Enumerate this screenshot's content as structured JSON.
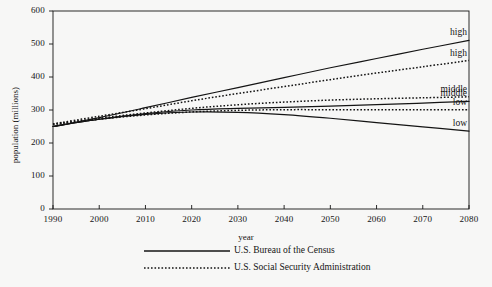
{
  "chart_data": {
    "type": "line",
    "title": "",
    "xlabel": "year",
    "ylabel": "population (millions)",
    "xlim": [
      1990,
      2080
    ],
    "ylim": [
      0,
      600
    ],
    "xticks": [
      1990,
      2000,
      2010,
      2020,
      2030,
      2040,
      2050,
      2060,
      2070,
      2080
    ],
    "yticks": [
      0,
      100,
      200,
      300,
      400,
      500,
      600
    ],
    "grid": false,
    "legend_position": "bottom",
    "x": [
      1990,
      2000,
      2010,
      2020,
      2030,
      2040,
      2050,
      2060,
      2070,
      2080
    ],
    "series": [
      {
        "name": "U.S. Bureau of the Census — high",
        "source": "U.S. Bureau of the Census",
        "variant": "high",
        "style": "solid",
        "end_label": "high",
        "values": [
          250,
          277,
          307,
          338,
          368,
          398,
          428,
          456,
          484,
          511
        ]
      },
      {
        "name": "U.S. Social Security Administration — high",
        "source": "U.S. Social Security Administration",
        "variant": "high",
        "style": "dotted",
        "end_label": "high",
        "values": [
          258,
          281,
          304,
          328,
          350,
          371,
          392,
          412,
          431,
          450
        ]
      },
      {
        "name": "U.S. Social Security Administration — middle",
        "source": "U.S. Social Security Administration",
        "variant": "middle",
        "style": "dotted",
        "end_label": "middle",
        "values": [
          257,
          275,
          291,
          305,
          316,
          324,
          330,
          334,
          337,
          340
        ]
      },
      {
        "name": "U.S. Bureau of the Census — middle",
        "source": "U.S. Bureau of the Census",
        "variant": "middle",
        "style": "solid",
        "end_label": "middle",
        "values": [
          250,
          272,
          289,
          300,
          305,
          308,
          312,
          316,
          321,
          326
        ]
      },
      {
        "name": "U.S. Social Security Administration — low",
        "source": "U.S. Social Security Administration",
        "variant": "low",
        "style": "dotted",
        "end_label": "low",
        "values": [
          256,
          272,
          285,
          294,
          299,
          301,
          301,
          301,
          301,
          301
        ]
      },
      {
        "name": "U.S. Bureau of the Census — low",
        "source": "U.S. Bureau of the Census",
        "variant": "low",
        "style": "solid",
        "end_label": "low",
        "values": [
          250,
          272,
          287,
          294,
          293,
          286,
          275,
          262,
          249,
          236
        ]
      }
    ],
    "legend": [
      {
        "label": "U.S. Bureau of the Census",
        "style": "solid"
      },
      {
        "label": "U.S. Social Security Administration",
        "style": "dotted"
      }
    ],
    "colors": {
      "line": "#141414",
      "axis": "#141414",
      "background": "#f7f7f6",
      "text": "#141414"
    }
  }
}
